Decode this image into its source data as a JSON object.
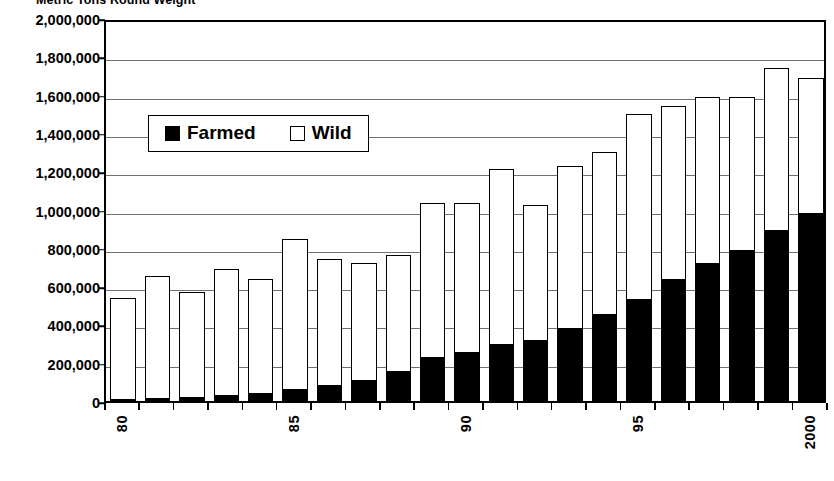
{
  "chart_data": {
    "type": "bar",
    "subtype": "stacked-vertical",
    "title": "Metric Tons Round Weight",
    "xlabel": "",
    "ylabel": "",
    "ylim": [
      0,
      2000000
    ],
    "ytick_step": 200000,
    "grid": true,
    "legend_position": "inside-upper-left",
    "categories": [
      "80",
      "81",
      "82",
      "83",
      "84",
      "85",
      "86",
      "87",
      "88",
      "89",
      "90",
      "91",
      "92",
      "93",
      "94",
      "95",
      "96",
      "97",
      "98",
      "99",
      "2000"
    ],
    "xtick_labels_shown": [
      "80",
      "85",
      "90",
      "95",
      "2000"
    ],
    "ytick_labels": [
      "0",
      "200,000",
      "400,000",
      "600,000",
      "800,000",
      "1,000,000",
      "1,200,000",
      "1,400,000",
      "1,600,000",
      "1,800,000",
      "2,000,000"
    ],
    "ytick_values": [
      0,
      200000,
      400000,
      600000,
      800000,
      1000000,
      1200000,
      1400000,
      1600000,
      1800000,
      2000000
    ],
    "series": [
      {
        "name": "Farmed",
        "color": "#000000",
        "values": [
          5000,
          10000,
          15000,
          25000,
          35000,
          55000,
          80000,
          105000,
          150000,
          225000,
          250000,
          295000,
          315000,
          375000,
          450000,
          525000,
          630000,
          715000,
          785000,
          890000,
          975000
        ]
      },
      {
        "name": "Wild",
        "color": "#ffffff",
        "values": [
          535000,
          645000,
          555000,
          665000,
          600000,
          790000,
          660000,
          615000,
          610000,
          810000,
          785000,
          915000,
          710000,
          850000,
          850000,
          975000,
          910000,
          875000,
          805000,
          850000,
          710000
        ]
      }
    ],
    "totals": [
      540000,
      655000,
      570000,
      690000,
      635000,
      845000,
      740000,
      720000,
      760000,
      1035000,
      1035000,
      1210000,
      1025000,
      1225000,
      1300000,
      1500000,
      1540000,
      1590000,
      1590000,
      1740000,
      1685000
    ]
  },
  "legend": {
    "items": [
      {
        "label": "Farmed",
        "swatch": "filled-black-square"
      },
      {
        "label": "Wild",
        "swatch": "open-white-square"
      }
    ]
  },
  "colors": {
    "farmed": "#000000",
    "wild": "#ffffff",
    "axis": "#000000",
    "grid": "#707070",
    "background": "#ffffff"
  }
}
